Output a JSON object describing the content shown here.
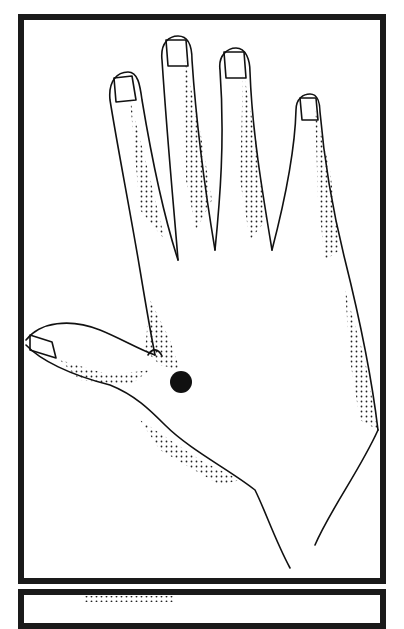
{
  "figure": {
    "marker": {
      "label": "Acupressure point between thumb and index finger",
      "shape": "filled circle",
      "color": "#111111",
      "cx": 181,
      "cy": 382,
      "r": 11
    },
    "frame_color": "#1a1a1a",
    "shading": "stippled dots"
  },
  "panels": [
    {
      "id": "main",
      "content": "hand illustration with marked point"
    },
    {
      "id": "next",
      "content": "top edge of following illustration panel (cropped)"
    }
  ]
}
